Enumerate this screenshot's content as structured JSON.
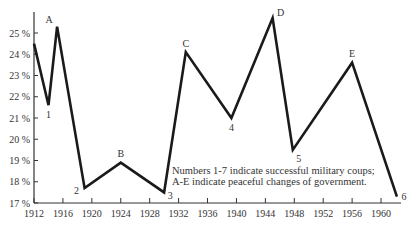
{
  "chart_data": {
    "type": "line",
    "title": "",
    "xlabel": "",
    "ylabel": "",
    "xlim": [
      1912,
      1963
    ],
    "ylim": [
      17,
      25.9
    ],
    "grid": false,
    "x_ticks": [
      "1912",
      "1916",
      "1920",
      "1924",
      "1928",
      "1932",
      "1936",
      "1940",
      "1944",
      "1948",
      "1952",
      "1956",
      "1960"
    ],
    "y_ticks": [
      "17%",
      "18%",
      "19%",
      "20%",
      "21%",
      "22%",
      "23%",
      "24%",
      "25%"
    ],
    "series": [
      {
        "name": "series",
        "points": [
          {
            "x": 1912.0,
            "y": 24.5,
            "label": ""
          },
          {
            "x": 1914.0,
            "y": 21.6,
            "label": "1"
          },
          {
            "x": 1915.2,
            "y": 25.3,
            "label": "A"
          },
          {
            "x": 1919.0,
            "y": 17.7,
            "label": "2"
          },
          {
            "x": 1924.0,
            "y": 18.9,
            "label": "B"
          },
          {
            "x": 1930.0,
            "y": 17.5,
            "label": "3"
          },
          {
            "x": 1933.0,
            "y": 24.1,
            "label": "C"
          },
          {
            "x": 1939.3,
            "y": 21.0,
            "label": "4"
          },
          {
            "x": 1945.0,
            "y": 25.7,
            "label": "D"
          },
          {
            "x": 1947.8,
            "y": 19.5,
            "label": "5"
          },
          {
            "x": 1956.0,
            "y": 23.6,
            "label": "E"
          },
          {
            "x": 1962.2,
            "y": 17.3,
            "label": "6"
          }
        ]
      }
    ],
    "annotations": [
      "Numbers 1-7 indicate successful military coups;",
      "A-E indicate peaceful changes of government."
    ]
  },
  "legend": {
    "line1": "Numbers 1-7 indicate successful military coups;",
    "line2": "A-E indicate peaceful changes of government."
  }
}
